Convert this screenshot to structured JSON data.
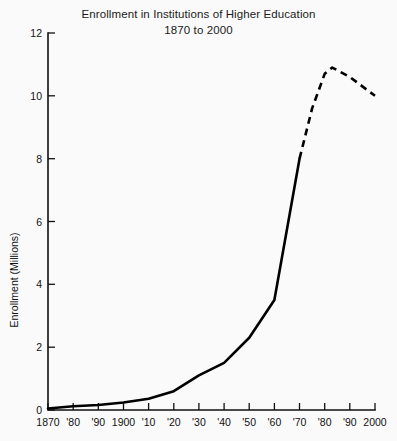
{
  "chart_data": {
    "type": "line",
    "title": "Enrollment in Institutions of Higher Education",
    "subtitle": "1870 to 2000",
    "xlabel": "",
    "ylabel": "Enrollment (Millions)",
    "xlim": [
      1870,
      2000
    ],
    "ylim": [
      0,
      12
    ],
    "grid": false,
    "legend": "none",
    "y_ticks": [
      0,
      2,
      4,
      6,
      8,
      10,
      12
    ],
    "y_tick_labels": [
      "0",
      "2",
      "4",
      "6",
      "8",
      "10",
      "12"
    ],
    "x_ticks": [
      1870,
      1880,
      1890,
      1900,
      1910,
      1920,
      1930,
      1940,
      1950,
      1960,
      1970,
      1980,
      1990,
      2000
    ],
    "x_tick_labels": [
      "1870",
      "'80",
      "'90",
      "1900",
      "'10",
      "'20",
      "'30",
      "'40",
      "'50",
      "'60",
      "'70",
      "'80",
      "'90",
      "2000"
    ],
    "series": [
      {
        "name": "Actual enrollment",
        "style": "solid",
        "x": [
          1870,
          1880,
          1890,
          1900,
          1910,
          1920,
          1930,
          1940,
          1950,
          1960,
          1970
        ],
        "values": [
          0.05,
          0.12,
          0.16,
          0.24,
          0.36,
          0.6,
          1.1,
          1.5,
          2.3,
          3.5,
          8.0
        ]
      },
      {
        "name": "Projected enrollment",
        "style": "dashed",
        "x": [
          1970,
          1975,
          1980,
          1983,
          1990,
          2000
        ],
        "values": [
          8.0,
          9.6,
          10.7,
          10.9,
          10.6,
          10.0
        ]
      }
    ],
    "colors": {
      "line": "#000000",
      "axis": "#111111",
      "background": "#fafafa",
      "text": "#111111"
    }
  }
}
